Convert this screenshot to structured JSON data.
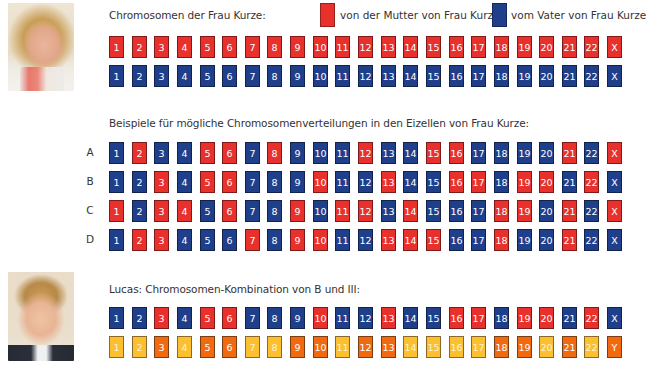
{
  "colors": {
    "maternal_red": "#e8302c",
    "paternal_blue": "#1f3f8a",
    "lucas_orange": "#f26a10",
    "lucas_yellow": "#fbbf30"
  },
  "mother_section": {
    "title": "Chromosomen der Frau Kurze:",
    "legend": [
      {
        "color": "red",
        "label": "von der Mutter von Frau Kurze"
      },
      {
        "color": "blue",
        "label": "vom Vater von Frau Kurze"
      }
    ],
    "rows": [
      {
        "name": "maternal",
        "cells": [
          {
            "n": "1",
            "c": "r"
          },
          {
            "n": "2",
            "c": "r"
          },
          {
            "n": "3",
            "c": "r"
          },
          {
            "n": "4",
            "c": "r"
          },
          {
            "n": "5",
            "c": "r"
          },
          {
            "n": "6",
            "c": "r"
          },
          {
            "n": "7",
            "c": "r"
          },
          {
            "n": "8",
            "c": "r"
          },
          {
            "n": "9",
            "c": "r"
          },
          {
            "n": "10",
            "c": "r"
          },
          {
            "n": "11",
            "c": "r"
          },
          {
            "n": "12",
            "c": "r"
          },
          {
            "n": "13",
            "c": "r"
          },
          {
            "n": "14",
            "c": "r"
          },
          {
            "n": "15",
            "c": "r"
          },
          {
            "n": "16",
            "c": "r"
          },
          {
            "n": "17",
            "c": "r"
          },
          {
            "n": "18",
            "c": "r"
          },
          {
            "n": "19",
            "c": "r"
          },
          {
            "n": "20",
            "c": "r"
          },
          {
            "n": "21",
            "c": "r"
          },
          {
            "n": "22",
            "c": "r"
          },
          {
            "n": "X",
            "c": "r"
          }
        ]
      },
      {
        "name": "paternal",
        "cells": [
          {
            "n": "1",
            "c": "b"
          },
          {
            "n": "2",
            "c": "b"
          },
          {
            "n": "3",
            "c": "b"
          },
          {
            "n": "4",
            "c": "b"
          },
          {
            "n": "5",
            "c": "b"
          },
          {
            "n": "6",
            "c": "b"
          },
          {
            "n": "7",
            "c": "b"
          },
          {
            "n": "8",
            "c": "b"
          },
          {
            "n": "9",
            "c": "b"
          },
          {
            "n": "10",
            "c": "b"
          },
          {
            "n": "11",
            "c": "b"
          },
          {
            "n": "12",
            "c": "b"
          },
          {
            "n": "13",
            "c": "b"
          },
          {
            "n": "14",
            "c": "b"
          },
          {
            "n": "15",
            "c": "b"
          },
          {
            "n": "16",
            "c": "b"
          },
          {
            "n": "17",
            "c": "b"
          },
          {
            "n": "18",
            "c": "b"
          },
          {
            "n": "19",
            "c": "b"
          },
          {
            "n": "20",
            "c": "b"
          },
          {
            "n": "21",
            "c": "b"
          },
          {
            "n": "22",
            "c": "b"
          },
          {
            "n": "X",
            "c": "b"
          }
        ]
      }
    ]
  },
  "examples_section": {
    "title": "Beispiele für mögliche Chromosomenverteilungen in den Eizellen von Frau Kurze:",
    "rows": [
      {
        "label": "A",
        "cells": [
          {
            "n": "1",
            "c": "b"
          },
          {
            "n": "2",
            "c": "r"
          },
          {
            "n": "3",
            "c": "b"
          },
          {
            "n": "4",
            "c": "b"
          },
          {
            "n": "5",
            "c": "r"
          },
          {
            "n": "6",
            "c": "r"
          },
          {
            "n": "7",
            "c": "b"
          },
          {
            "n": "8",
            "c": "r"
          },
          {
            "n": "9",
            "c": "b"
          },
          {
            "n": "10",
            "c": "b"
          },
          {
            "n": "11",
            "c": "b"
          },
          {
            "n": "12",
            "c": "r"
          },
          {
            "n": "13",
            "c": "b"
          },
          {
            "n": "14",
            "c": "b"
          },
          {
            "n": "15",
            "c": "r"
          },
          {
            "n": "16",
            "c": "r"
          },
          {
            "n": "17",
            "c": "b"
          },
          {
            "n": "18",
            "c": "b"
          },
          {
            "n": "19",
            "c": "b"
          },
          {
            "n": "20",
            "c": "b"
          },
          {
            "n": "21",
            "c": "r"
          },
          {
            "n": "22",
            "c": "b"
          },
          {
            "n": "X",
            "c": "r"
          }
        ]
      },
      {
        "label": "B",
        "cells": [
          {
            "n": "1",
            "c": "b"
          },
          {
            "n": "2",
            "c": "b"
          },
          {
            "n": "3",
            "c": "r"
          },
          {
            "n": "4",
            "c": "b"
          },
          {
            "n": "5",
            "c": "r"
          },
          {
            "n": "6",
            "c": "r"
          },
          {
            "n": "7",
            "c": "b"
          },
          {
            "n": "8",
            "c": "b"
          },
          {
            "n": "9",
            "c": "b"
          },
          {
            "n": "10",
            "c": "r"
          },
          {
            "n": "11",
            "c": "b"
          },
          {
            "n": "12",
            "c": "b"
          },
          {
            "n": "13",
            "c": "r"
          },
          {
            "n": "14",
            "c": "b"
          },
          {
            "n": "15",
            "c": "b"
          },
          {
            "n": "16",
            "c": "r"
          },
          {
            "n": "17",
            "c": "r"
          },
          {
            "n": "18",
            "c": "b"
          },
          {
            "n": "19",
            "c": "r"
          },
          {
            "n": "20",
            "c": "r"
          },
          {
            "n": "21",
            "c": "b"
          },
          {
            "n": "22",
            "c": "r"
          },
          {
            "n": "X",
            "c": "b"
          }
        ]
      },
      {
        "label": "C",
        "cells": [
          {
            "n": "1",
            "c": "r"
          },
          {
            "n": "2",
            "c": "b"
          },
          {
            "n": "3",
            "c": "r"
          },
          {
            "n": "4",
            "c": "r"
          },
          {
            "n": "5",
            "c": "b"
          },
          {
            "n": "6",
            "c": "r"
          },
          {
            "n": "7",
            "c": "b"
          },
          {
            "n": "8",
            "c": "b"
          },
          {
            "n": "9",
            "c": "r"
          },
          {
            "n": "10",
            "c": "b"
          },
          {
            "n": "11",
            "c": "r"
          },
          {
            "n": "12",
            "c": "r"
          },
          {
            "n": "13",
            "c": "b"
          },
          {
            "n": "14",
            "c": "r"
          },
          {
            "n": "15",
            "c": "b"
          },
          {
            "n": "16",
            "c": "b"
          },
          {
            "n": "17",
            "c": "b"
          },
          {
            "n": "18",
            "c": "r"
          },
          {
            "n": "19",
            "c": "r"
          },
          {
            "n": "20",
            "c": "b"
          },
          {
            "n": "21",
            "c": "r"
          },
          {
            "n": "22",
            "c": "b"
          },
          {
            "n": "X",
            "c": "r"
          }
        ]
      },
      {
        "label": "D",
        "cells": [
          {
            "n": "1",
            "c": "b"
          },
          {
            "n": "2",
            "c": "r"
          },
          {
            "n": "3",
            "c": "r"
          },
          {
            "n": "4",
            "c": "b"
          },
          {
            "n": "5",
            "c": "b"
          },
          {
            "n": "6",
            "c": "b"
          },
          {
            "n": "7",
            "c": "r"
          },
          {
            "n": "8",
            "c": "b"
          },
          {
            "n": "9",
            "c": "r"
          },
          {
            "n": "10",
            "c": "r"
          },
          {
            "n": "11",
            "c": "b"
          },
          {
            "n": "12",
            "c": "b"
          },
          {
            "n": "13",
            "c": "r"
          },
          {
            "n": "14",
            "c": "r"
          },
          {
            "n": "15",
            "c": "r"
          },
          {
            "n": "16",
            "c": "b"
          },
          {
            "n": "17",
            "c": "b"
          },
          {
            "n": "18",
            "c": "r"
          },
          {
            "n": "19",
            "c": "b"
          },
          {
            "n": "20",
            "c": "b"
          },
          {
            "n": "21",
            "c": "r"
          },
          {
            "n": "22",
            "c": "b"
          },
          {
            "n": "X",
            "c": "b"
          }
        ]
      }
    ]
  },
  "lucas_section": {
    "title": "Lucas: Chromosomen-Kombination von B und III:",
    "rows": [
      {
        "name": "from-mother-B",
        "cells": [
          {
            "n": "1",
            "c": "b"
          },
          {
            "n": "2",
            "c": "b"
          },
          {
            "n": "3",
            "c": "r"
          },
          {
            "n": "4",
            "c": "b"
          },
          {
            "n": "5",
            "c": "r"
          },
          {
            "n": "6",
            "c": "r"
          },
          {
            "n": "7",
            "c": "b"
          },
          {
            "n": "8",
            "c": "b"
          },
          {
            "n": "9",
            "c": "b"
          },
          {
            "n": "10",
            "c": "r"
          },
          {
            "n": "11",
            "c": "b"
          },
          {
            "n": "12",
            "c": "b"
          },
          {
            "n": "13",
            "c": "r"
          },
          {
            "n": "14",
            "c": "b"
          },
          {
            "n": "15",
            "c": "b"
          },
          {
            "n": "16",
            "c": "r"
          },
          {
            "n": "17",
            "c": "r"
          },
          {
            "n": "18",
            "c": "b"
          },
          {
            "n": "19",
            "c": "r"
          },
          {
            "n": "20",
            "c": "r"
          },
          {
            "n": "21",
            "c": "b"
          },
          {
            "n": "22",
            "c": "r"
          },
          {
            "n": "X",
            "c": "b"
          }
        ]
      },
      {
        "name": "from-father-III",
        "cells": [
          {
            "n": "1",
            "c": "y"
          },
          {
            "n": "2",
            "c": "y"
          },
          {
            "n": "3",
            "c": "o"
          },
          {
            "n": "4",
            "c": "y"
          },
          {
            "n": "5",
            "c": "o"
          },
          {
            "n": "6",
            "c": "o"
          },
          {
            "n": "7",
            "c": "y"
          },
          {
            "n": "8",
            "c": "y"
          },
          {
            "n": "9",
            "c": "o"
          },
          {
            "n": "10",
            "c": "o"
          },
          {
            "n": "11",
            "c": "y"
          },
          {
            "n": "12",
            "c": "o"
          },
          {
            "n": "13",
            "c": "o"
          },
          {
            "n": "14",
            "c": "y"
          },
          {
            "n": "15",
            "c": "y"
          },
          {
            "n": "16",
            "c": "y"
          },
          {
            "n": "17",
            "c": "y"
          },
          {
            "n": "18",
            "c": "o"
          },
          {
            "n": "19",
            "c": "o"
          },
          {
            "n": "20",
            "c": "y"
          },
          {
            "n": "21",
            "c": "o"
          },
          {
            "n": "22",
            "c": "y"
          },
          {
            "n": "Y",
            "c": "o"
          }
        ]
      }
    ]
  }
}
